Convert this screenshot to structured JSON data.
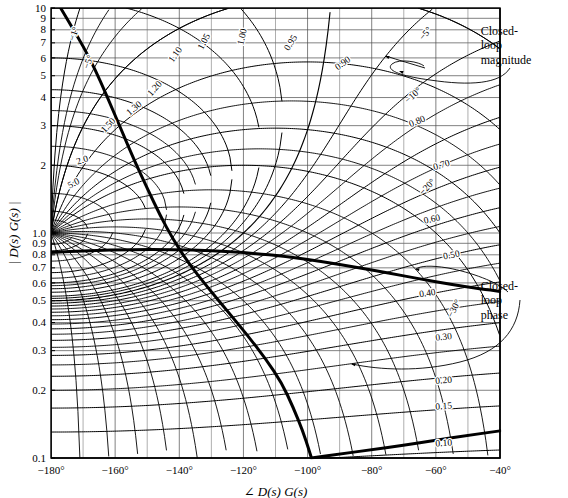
{
  "chart_data": {
    "type": "line",
    "xlabel": "∠ D(s) G(s)",
    "ylabel": "| D(s) G(s) |",
    "xlim": [
      -180,
      -40
    ],
    "ylim": [
      0.1,
      10
    ],
    "yscale": "log",
    "xscale": "linear",
    "grid": true,
    "xticks": [
      -180,
      -160,
      -140,
      -120,
      -100,
      -80,
      -60,
      -40
    ],
    "xtick_labels": [
      "−180°",
      "−160°",
      "−140°",
      "−120°",
      "−100°",
      "−80°",
      "−60°",
      "−40°"
    ],
    "yticks": [
      0.1,
      0.2,
      0.3,
      0.4,
      0.5,
      0.6,
      0.7,
      0.8,
      0.9,
      1.0,
      2,
      3,
      4,
      5,
      6,
      7,
      8,
      9,
      10
    ],
    "ytick_labels": [
      "0.1",
      "0.2",
      "0.3",
      "0.4",
      "0.5",
      "0.6",
      "0.7",
      "0.8",
      "0.9",
      "1.0",
      "2",
      "3",
      "4",
      "5",
      "6",
      "7",
      "8",
      "9",
      "10"
    ],
    "magnitude_contours": [
      {
        "label": "5.0",
        "value": 5.0,
        "label_x": -172.5,
        "label_y": 1.62,
        "rot": -28
      },
      {
        "label": "2.0",
        "value": 2.0,
        "label_x": -170.0,
        "label_y": 2.05,
        "rot": -18
      },
      {
        "label": "1.50",
        "value": 1.5,
        "label_x": -161.5,
        "label_y": 2.95,
        "rot": -47
      },
      {
        "label": "1.30",
        "value": 1.3,
        "label_x": -153.5,
        "label_y": 3.5,
        "rot": -40
      },
      {
        "label": "1.20",
        "value": 1.2,
        "label_x": -147.0,
        "label_y": 4.3,
        "rot": -48
      },
      {
        "label": "1.10",
        "value": 1.1,
        "label_x": -140.5,
        "label_y": 6.1,
        "rot": -55
      },
      {
        "label": "1.05",
        "value": 1.05,
        "label_x": -131.5,
        "label_y": 7.0,
        "rot": -63
      },
      {
        "label": "1.00",
        "value": 1.0,
        "label_x": -119.5,
        "label_y": 7.4,
        "rot": -78
      },
      {
        "label": "0.95",
        "value": 0.95,
        "label_x": -104.5,
        "label_y": 6.9,
        "rot": -58
      },
      {
        "label": "0.90",
        "value": 0.9,
        "label_x": -88.5,
        "label_y": 5.55,
        "rot": -36
      },
      {
        "label": "0.80",
        "value": 0.8,
        "label_x": -65.5,
        "label_y": 3.05,
        "rot": -23
      },
      {
        "label": "0.70",
        "value": 0.7,
        "label_x": -58.0,
        "label_y": 1.95,
        "rot": -17
      },
      {
        "label": "0.60",
        "value": 0.6,
        "label_x": -61.0,
        "label_y": 1.12,
        "rot": -13
      },
      {
        "label": "0.50",
        "value": 0.5,
        "label_x": -55.0,
        "label_y": 0.775,
        "rot": -11
      },
      {
        "label": "0.40",
        "value": 0.4,
        "label_x": -62.5,
        "label_y": 0.525,
        "rot": -9
      },
      {
        "label": "0.30",
        "value": 0.3,
        "label_x": -57.5,
        "label_y": 0.335,
        "rot": -7
      },
      {
        "label": "0.20",
        "value": 0.2,
        "label_x": -57.5,
        "label_y": 0.215,
        "rot": -5
      },
      {
        "label": "0.15",
        "value": 0.15,
        "label_x": -57.5,
        "label_y": 0.165,
        "rot": -4
      },
      {
        "label": "0.10",
        "value": 0.1,
        "label_x": -57.5,
        "label_y": 0.113,
        "rot": -3
      }
    ],
    "phase_contours": [
      {
        "label": "−1°",
        "value": -1,
        "label_x": -172.0,
        "label_y": 7.6,
        "rot": -72
      },
      {
        "label": "−5°",
        "value": -5,
        "label_x": -167.5,
        "label_y": 5.7,
        "rot": -70
      },
      {
        "label": "−5°",
        "value": -5,
        "label_x": -62.5,
        "label_y": 7.55,
        "rot": -50
      },
      {
        "label": "−10°",
        "value": -10,
        "label_x": -66.5,
        "label_y": 4.0,
        "rot": -42
      },
      {
        "label": "−20°",
        "value": -20,
        "label_x": -62.0,
        "label_y": 1.57,
        "rot": -47
      },
      {
        "label": "−30°",
        "value": -30,
        "label_x": -53.5,
        "label_y": 0.455,
        "rot": -62
      }
    ],
    "annotations": [
      {
        "name": "closed-loop-magnitude",
        "text": "Closed-\nloop\nmagnitude",
        "lines": [
          "Closed-",
          "loop",
          "magnitude"
        ],
        "x": -46.0,
        "y": 7.6,
        "points_to_label": "0.90"
      },
      {
        "name": "closed-loop-phase",
        "text": "Closed-\nloop\nphase",
        "lines": [
          "Closed-",
          "loop",
          "phase"
        ],
        "x": -46.0,
        "y": 0.56,
        "points_to_label": "−30°"
      }
    ],
    "open_loop_curve": {
      "name": "open-loop-frequency-response",
      "style": "heavy-solid",
      "description": "Heavy open-loop D(s)G(s) response traversing from upper-left down through the chart and off the lower edge near −100°, then re-entering at lower right.",
      "points": [
        [
          -177.0,
          10.0
        ],
        [
          -172.0,
          7.6
        ],
        [
          -168.0,
          6.0
        ],
        [
          -164.5,
          4.7
        ],
        [
          -161.0,
          3.6
        ],
        [
          -157.5,
          2.75
        ],
        [
          -154.0,
          2.1
        ],
        [
          -150.0,
          1.58
        ],
        [
          -146.0,
          1.2
        ],
        [
          -142.0,
          0.94
        ],
        [
          -137.0,
          0.73
        ],
        [
          -131.0,
          0.57
        ],
        [
          -125.0,
          0.45
        ],
        [
          -119.0,
          0.355
        ],
        [
          -113.0,
          0.275
        ],
        [
          -108.0,
          0.215
        ],
        [
          -104.5,
          0.168
        ],
        [
          -101.5,
          0.132
        ],
        [
          -99.5,
          0.108
        ],
        [
          -98.8,
          0.1
        ]
      ]
    },
    "open_loop_curve_2": {
      "name": "open-loop-low-magnitude-tail",
      "style": "heavy-solid",
      "description": "Heavy flat branch running from the left axis near 0.82 across to the right edge near 0.58, and a shallow branch near 0.10 along the bottom right.",
      "points": [
        [
          -180.0,
          0.82
        ],
        [
          -168.0,
          0.835
        ],
        [
          -155.0,
          0.845
        ],
        [
          -142.0,
          0.845
        ],
        [
          -130.0,
          0.835
        ],
        [
          -118.0,
          0.815
        ],
        [
          -106.0,
          0.785
        ],
        [
          -95.0,
          0.745
        ],
        [
          -85.0,
          0.705
        ],
        [
          -75.0,
          0.665
        ],
        [
          -65.0,
          0.625
        ],
        [
          -55.0,
          0.59
        ],
        [
          -46.0,
          0.565
        ],
        [
          -40.0,
          0.55
        ]
      ]
    },
    "open_loop_curve_3": {
      "name": "open-loop-bottom-branch",
      "style": "heavy-solid",
      "description": "Heavy shallow branch along the bottom from about −100° rising slowly to the right edge.",
      "points": [
        [
          -98.8,
          0.1
        ],
        [
          -90.0,
          0.104
        ],
        [
          -80.0,
          0.109
        ],
        [
          -70.0,
          0.114
        ],
        [
          -60.0,
          0.12
        ],
        [
          -50.0,
          0.126
        ],
        [
          -40.0,
          0.132
        ]
      ]
    }
  },
  "colors": {
    "ink": "#000000",
    "grid": "#555555",
    "background": "#ffffff",
    "contour_heavy": "#000000"
  }
}
